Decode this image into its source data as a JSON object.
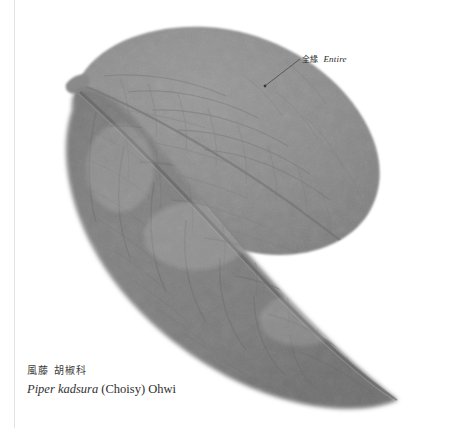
{
  "page": {
    "background_color": "#ffffff",
    "gutter_rule_color": "#e2e2e2"
  },
  "specimen": {
    "subject": "pressed leaves of Piper kadsura",
    "leaf_count": 2,
    "leaf_arrangement": "two overlapping ovate leaves, paler leaf behind upper-left, darker leaf in front lower-right",
    "venation": "reticulate with prominent midrib",
    "margin_type": "entire",
    "apex_type": "acuminate",
    "base_type": "rounded",
    "colors": {
      "back_leaf_fill": "#8e8e8e",
      "back_leaf_edge": "#7c7c7c",
      "front_leaf_fill": "#7f7f7f",
      "front_leaf_edge": "#6e6e6e",
      "midrib": "#6a6a6a",
      "vein": "#737373",
      "vein_light": "#999999",
      "petiole": "#8a8a8a"
    }
  },
  "annotation": {
    "label_cjk": "全緣",
    "label_latin": "Entire",
    "leader_line_color": "#4a4a4a",
    "leader_from_x": 300,
    "leader_from_y": 59,
    "leader_to_x": 265,
    "leader_to_y": 86
  },
  "caption": {
    "common_name": "風藤 胡椒科",
    "binomial": "Piper kadsura",
    "authority": "(Choisy) Ohwi"
  }
}
